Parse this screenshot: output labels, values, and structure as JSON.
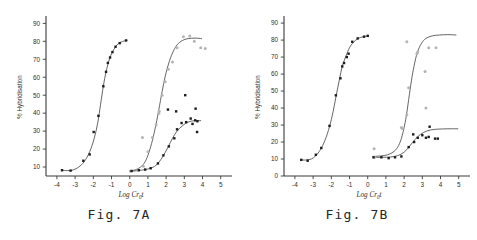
{
  "figure": {
    "panels": [
      {
        "caption": "Fig. 7A"
      },
      {
        "caption": "Fig. 7B"
      }
    ]
  },
  "chart_data": [
    {
      "type": "scatter",
      "title": "Fig. 7A",
      "xlabel": "Log Cr0t",
      "xlabel_parts": {
        "prefix": "Log  Cr",
        "sub": "0",
        "suffix": "t"
      },
      "ylabel": "% Hybridisation",
      "xlim": [
        -4.6,
        5.4
      ],
      "ylim": [
        5,
        93
      ],
      "xticks": [
        -4,
        -3,
        -2,
        -1,
        0,
        1,
        2,
        3,
        4,
        5
      ],
      "xticklabels": [
        "-4",
        "-3",
        "-2",
        "-1",
        "0",
        "1",
        "2",
        "3",
        "4",
        "5"
      ],
      "yticks": [
        10,
        20,
        30,
        40,
        50,
        60,
        70,
        80,
        90
      ],
      "yticklabels": [
        "10",
        "20",
        "30",
        "40",
        "50",
        "60",
        "70",
        "80",
        "90"
      ],
      "grid": false,
      "legend": "none",
      "y_axis_starts_at_zero": false,
      "series": [
        {
          "name": "fast-component-curve",
          "marker": "filled-square",
          "curve": [
            [
              -3.75,
              8.2
            ],
            [
              -3.4,
              8.0
            ],
            [
              -3.1,
              8.4
            ],
            [
              -2.8,
              10.0
            ],
            [
              -2.5,
              13.0
            ],
            [
              -2.2,
              18.5
            ],
            [
              -1.95,
              26.0
            ],
            [
              -1.75,
              35.0
            ],
            [
              -1.6,
              45.0
            ],
            [
              -1.45,
              55.0
            ],
            [
              -1.3,
              63.0
            ],
            [
              -1.1,
              70.5
            ],
            [
              -0.9,
              75.0
            ],
            [
              -0.7,
              78.0
            ],
            [
              -0.5,
              79.5
            ],
            [
              -0.3,
              80.2
            ],
            [
              -0.15,
              80.5
            ]
          ],
          "points": [
            [
              -3.72,
              8.2
            ],
            [
              -3.25,
              8.0
            ],
            [
              -2.55,
              13.5
            ],
            [
              -2.2,
              17.0
            ],
            [
              -1.98,
              29.5
            ],
            [
              -1.72,
              38.5
            ],
            [
              -1.45,
              55.0
            ],
            [
              -1.3,
              63.0
            ],
            [
              -1.2,
              68.0
            ],
            [
              -1.08,
              71.0
            ],
            [
              -0.95,
              74.0
            ],
            [
              -0.78,
              77.0
            ],
            [
              -0.55,
              79.0
            ],
            [
              -0.2,
              80.5
            ]
          ]
        },
        {
          "name": "slow-component-curve-upper",
          "marker": "open-circle",
          "curve": [
            [
              0.0,
              7.8
            ],
            [
              0.3,
              8.4
            ],
            [
              0.6,
              10.0
            ],
            [
              0.85,
              13.0
            ],
            [
              1.05,
              18.0
            ],
            [
              1.25,
              25.0
            ],
            [
              1.45,
              34.0
            ],
            [
              1.6,
              42.0
            ],
            [
              1.78,
              52.0
            ],
            [
              1.95,
              60.5
            ],
            [
              2.15,
              68.0
            ],
            [
              2.35,
              73.5
            ],
            [
              2.6,
              78.0
            ],
            [
              2.9,
              80.5
            ],
            [
              3.2,
              81.5
            ],
            [
              3.6,
              81.8
            ],
            [
              3.95,
              81.5
            ]
          ],
          "points": [
            [
              0.05,
              7.6
            ],
            [
              0.45,
              8.5
            ],
            [
              0.75,
              10.5
            ],
            [
              1.0,
              18.5
            ],
            [
              1.25,
              26.5
            ],
            [
              1.45,
              33.5
            ],
            [
              1.6,
              40.0
            ],
            [
              1.62,
              41.0
            ],
            [
              1.78,
              50.0
            ],
            [
              1.95,
              57.5
            ],
            [
              2.12,
              64.5
            ],
            [
              2.35,
              68.5
            ],
            [
              2.6,
              76.5
            ],
            [
              2.95,
              82.5
            ],
            [
              3.3,
              83.0
            ],
            [
              3.55,
              80.0
            ],
            [
              3.9,
              76.5
            ],
            [
              4.15,
              76.0
            ],
            [
              0.7,
              26.5
            ]
          ]
        },
        {
          "name": "slow-component-curve-lower",
          "marker": "filled-square",
          "curve": [
            [
              0.0,
              7.6
            ],
            [
              0.45,
              8.0
            ],
            [
              0.85,
              8.6
            ],
            [
              1.2,
              9.5
            ],
            [
              1.5,
              11.5
            ],
            [
              1.8,
              15.5
            ],
            [
              2.1,
              21.0
            ],
            [
              2.35,
              26.0
            ],
            [
              2.6,
              30.0
            ],
            [
              2.9,
              33.0
            ],
            [
              3.2,
              35.0
            ],
            [
              3.55,
              35.8
            ],
            [
              3.9,
              35.8
            ]
          ],
          "points": [
            [
              0.1,
              7.8
            ],
            [
              0.5,
              8.2
            ],
            [
              0.85,
              8.6
            ],
            [
              1.15,
              9.3
            ],
            [
              1.55,
              12.0
            ],
            [
              1.85,
              16.5
            ],
            [
              2.15,
              21.5
            ],
            [
              2.45,
              26.0
            ],
            [
              2.6,
              31.0
            ],
            [
              2.85,
              34.5
            ],
            [
              3.1,
              35.0
            ],
            [
              3.35,
              37.0
            ],
            [
              3.45,
              34.0
            ],
            [
              3.6,
              36.0
            ],
            [
              3.72,
              35.5
            ],
            [
              3.62,
              42.5
            ],
            [
              3.7,
              29.5
            ],
            [
              3.05,
              50.0
            ],
            [
              2.55,
              41.0
            ],
            [
              2.1,
              42.0
            ]
          ]
        }
      ]
    },
    {
      "type": "scatter",
      "title": "Fig. 7B",
      "xlabel": "Log Cr0t",
      "xlabel_parts": {
        "prefix": "Log  Cr",
        "sub": "0",
        "suffix": "t"
      },
      "ylabel": "% Hybridisation",
      "xlim": [
        -4.6,
        5.4
      ],
      "ylim": [
        0,
        93
      ],
      "xticks": [
        -4,
        -3,
        -2,
        -1,
        0,
        1,
        2,
        3,
        4,
        5
      ],
      "xticklabels": [
        "-4",
        "-3",
        "-2",
        "-1",
        "0",
        "1",
        "2",
        "3",
        "4",
        "5"
      ],
      "yticks": [
        0,
        10,
        20,
        30,
        40,
        50,
        60,
        70,
        80,
        90
      ],
      "yticklabels": [
        "0",
        "10",
        "20",
        "30",
        "40",
        "50",
        "60",
        "70",
        "80",
        "90"
      ],
      "grid": false,
      "legend": "none",
      "y_axis_starts_at_zero": true,
      "series": [
        {
          "name": "fast-component-curve",
          "marker": "filled-square",
          "curve": [
            [
              -3.7,
              9.5
            ],
            [
              -3.4,
              9.4
            ],
            [
              -3.1,
              10.0
            ],
            [
              -2.85,
              12.0
            ],
            [
              -2.6,
              15.5
            ],
            [
              -2.35,
              21.0
            ],
            [
              -2.1,
              29.0
            ],
            [
              -1.9,
              38.0
            ],
            [
              -1.72,
              48.0
            ],
            [
              -1.55,
              57.0
            ],
            [
              -1.4,
              64.5
            ],
            [
              -1.2,
              70.5
            ],
            [
              -1.0,
              75.5
            ],
            [
              -0.8,
              78.5
            ],
            [
              -0.55,
              80.8
            ],
            [
              -0.25,
              82.0
            ],
            [
              0.05,
              82.5
            ]
          ],
          "points": [
            [
              -3.65,
              9.5
            ],
            [
              -3.3,
              9.0
            ],
            [
              -2.85,
              12.5
            ],
            [
              -2.55,
              16.5
            ],
            [
              -2.1,
              29.5
            ],
            [
              -1.75,
              47.5
            ],
            [
              -1.5,
              57.5
            ],
            [
              -1.4,
              64.5
            ],
            [
              -1.3,
              66.5
            ],
            [
              -1.15,
              70.0
            ],
            [
              -1.05,
              72.0
            ],
            [
              -0.85,
              79.0
            ],
            [
              -0.55,
              81.0
            ],
            [
              -0.2,
              82.0
            ],
            [
              0.0,
              82.5
            ]
          ]
        },
        {
          "name": "slow-component-curve-upper",
          "marker": "open-circle",
          "curve": [
            [
              0.3,
              11.5
            ],
            [
              0.7,
              11.8
            ],
            [
              1.1,
              12.5
            ],
            [
              1.45,
              14.5
            ],
            [
              1.7,
              18.0
            ],
            [
              1.9,
              24.0
            ],
            [
              2.1,
              34.0
            ],
            [
              2.25,
              45.0
            ],
            [
              2.4,
              56.0
            ],
            [
              2.55,
              65.0
            ],
            [
              2.72,
              72.5
            ],
            [
              2.95,
              78.0
            ],
            [
              3.2,
              81.0
            ],
            [
              3.55,
              82.5
            ],
            [
              3.95,
              83.0
            ],
            [
              4.4,
              83.2
            ],
            [
              4.85,
              83.0
            ]
          ],
          "points": [
            [
              0.35,
              16.0
            ],
            [
              0.38,
              11.0
            ],
            [
              1.85,
              28.5
            ],
            [
              1.9,
              28.0
            ],
            [
              2.15,
              36.0
            ],
            [
              2.25,
              52.0
            ],
            [
              2.15,
              79.0
            ],
            [
              2.7,
              72.0
            ],
            [
              2.75,
              73.0
            ],
            [
              3.15,
              61.5
            ],
            [
              3.35,
              75.5
            ],
            [
              3.75,
              75.5
            ],
            [
              3.2,
              40.0
            ]
          ]
        },
        {
          "name": "slow-component-curve-lower",
          "marker": "filled-square",
          "curve": [
            [
              0.3,
              11.0
            ],
            [
              0.8,
              11.0
            ],
            [
              1.25,
              11.2
            ],
            [
              1.65,
              12.0
            ],
            [
              2.0,
              14.0
            ],
            [
              2.3,
              17.5
            ],
            [
              2.6,
              21.5
            ],
            [
              2.9,
              24.5
            ],
            [
              3.25,
              26.5
            ],
            [
              3.65,
              27.4
            ],
            [
              4.1,
              27.7
            ],
            [
              4.6,
              27.8
            ],
            [
              4.95,
              27.8
            ]
          ],
          "points": [
            [
              0.32,
              11.0
            ],
            [
              0.75,
              11.0
            ],
            [
              1.15,
              10.5
            ],
            [
              1.5,
              11.0
            ],
            [
              1.85,
              11.5
            ],
            [
              2.25,
              17.0
            ],
            [
              2.55,
              20.0
            ],
            [
              2.75,
              22.5
            ],
            [
              3.0,
              24.0
            ],
            [
              3.2,
              22.5
            ],
            [
              3.35,
              23.0
            ],
            [
              3.4,
              29.0
            ],
            [
              3.7,
              22.0
            ],
            [
              3.85,
              22.0
            ],
            [
              2.5,
              24.5
            ]
          ]
        }
      ]
    }
  ]
}
